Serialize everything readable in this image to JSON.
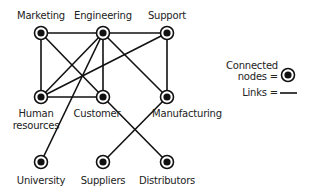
{
  "nodes": [
    {
      "id": "marketing",
      "label": "Marketing",
      "x": 41,
      "y": 33
    },
    {
      "id": "engineering",
      "label": "Engineering",
      "x": 103,
      "y": 33
    },
    {
      "id": "support",
      "label": "Support",
      "x": 167,
      "y": 33
    },
    {
      "id": "hr",
      "label": "Human resources",
      "label_lines": [
        "Human",
        "resources"
      ],
      "x": 41,
      "y": 97
    },
    {
      "id": "customer",
      "label": "Customer",
      "x": 103,
      "y": 97
    },
    {
      "id": "manufacturing",
      "label": "Manufacturing",
      "x": 167,
      "y": 97
    },
    {
      "id": "university",
      "label": "University",
      "x": 41,
      "y": 162
    },
    {
      "id": "suppliers",
      "label": "Suppliers",
      "x": 103,
      "y": 162
    },
    {
      "id": "distributors",
      "label": "Distributors",
      "x": 167,
      "y": 162
    }
  ],
  "links": [
    [
      "marketing",
      "engineering"
    ],
    [
      "engineering",
      "support"
    ],
    [
      "marketing",
      "hr"
    ],
    [
      "marketing",
      "customer"
    ],
    [
      "engineering",
      "hr"
    ],
    [
      "engineering",
      "customer"
    ],
    [
      "engineering",
      "manufacturing"
    ],
    [
      "engineering",
      "university"
    ],
    [
      "support",
      "hr"
    ],
    [
      "support",
      "manufacturing"
    ],
    [
      "hr",
      "customer"
    ],
    [
      "customer",
      "distributors"
    ],
    [
      "manufacturing",
      "suppliers"
    ]
  ],
  "legend": {
    "nodes_line1": "Connected",
    "nodes_line2": "nodes =",
    "links": "Links ="
  },
  "labels": {
    "marketing": "Marketing",
    "engineering": "Engineering",
    "support": "Support",
    "hr_line1": "Human",
    "hr_line2": "resources",
    "customer": "Customer",
    "manufacturing": "Manufacturing",
    "university": "University",
    "suppliers": "Suppliers",
    "distributors": "Distributors"
  }
}
